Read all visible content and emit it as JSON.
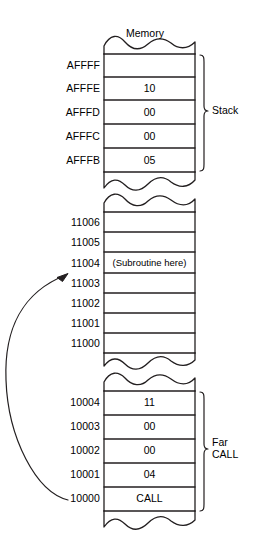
{
  "figure": {
    "title": "Memory"
  },
  "blocks": [
    {
      "name": "stack-block",
      "bracket_label": "Stack",
      "rows": [
        {
          "address": "AFFFF",
          "value": ""
        },
        {
          "address": "AFFFE",
          "value": "10"
        },
        {
          "address": "AFFFD",
          "value": "00"
        },
        {
          "address": "AFFFC",
          "value": "00"
        },
        {
          "address": "AFFFB",
          "value": "05"
        }
      ]
    },
    {
      "name": "subroutine-block",
      "bracket_label": "",
      "rows": [
        {
          "address": "11006",
          "value": ""
        },
        {
          "address": "11005",
          "value": ""
        },
        {
          "address": "11004",
          "value": "(Subroutine here)"
        },
        {
          "address": "11003",
          "value": ""
        },
        {
          "address": "11002",
          "value": ""
        },
        {
          "address": "11001",
          "value": ""
        },
        {
          "address": "11000",
          "value": ""
        }
      ]
    },
    {
      "name": "call-block",
      "bracket_label": "Far\nCALL",
      "rows": [
        {
          "address": "10004",
          "value": "11"
        },
        {
          "address": "10003",
          "value": "00"
        },
        {
          "address": "10002",
          "value": "00"
        },
        {
          "address": "10001",
          "value": "04"
        },
        {
          "address": "10000",
          "value": "CALL"
        }
      ]
    }
  ],
  "colors": {
    "stroke": "#231f20",
    "background": "#ffffff"
  }
}
